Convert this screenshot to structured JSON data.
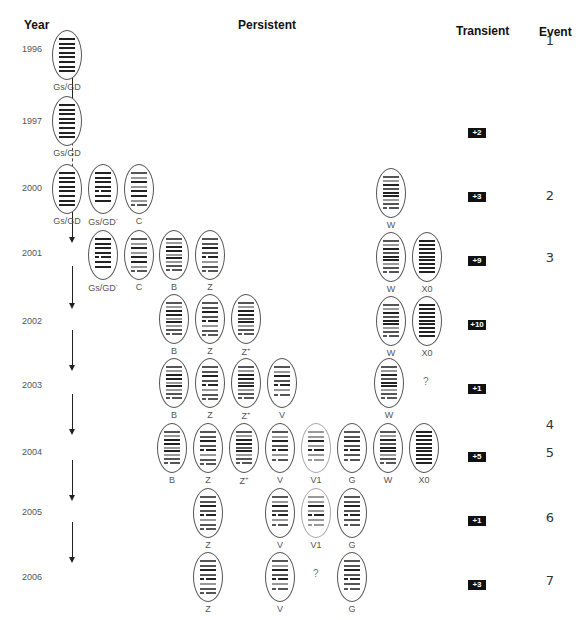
{
  "headers": {
    "year": "Year",
    "persistent": "Persistent",
    "transient": "Transient",
    "event": "Event"
  },
  "colors": {
    "dark_band": "#222222",
    "mid_band": "#555555",
    "light_band": "#999999",
    "badge_bg": "#111111"
  },
  "years": [
    {
      "label": "1996",
      "y": 44
    },
    {
      "label": "1997",
      "y": 116
    },
    {
      "label": "2000",
      "y": 183
    },
    {
      "label": "2001",
      "y": 248
    },
    {
      "label": "2002",
      "y": 316
    },
    {
      "label": "2003",
      "y": 380
    },
    {
      "label": "2004",
      "y": 447
    },
    {
      "label": "2005",
      "y": 507
    },
    {
      "label": "2006",
      "y": 572
    }
  ],
  "transient_counts": [
    {
      "label": "+2",
      "y": 128
    },
    {
      "label": "+3",
      "y": 192
    },
    {
      "label": "+9",
      "y": 256
    },
    {
      "label": "+10",
      "y": 320
    },
    {
      "label": "+1",
      "y": 384
    },
    {
      "label": "+5",
      "y": 452
    },
    {
      "label": "+1",
      "y": 516
    },
    {
      "label": "+3",
      "y": 580
    }
  ],
  "events": [
    {
      "label": "1",
      "y": 33
    },
    {
      "label": "2",
      "y": 188
    },
    {
      "label": "3",
      "y": 250
    },
    {
      "label": "4",
      "y": 417
    },
    {
      "label": "5",
      "y": 445
    },
    {
      "label": "6",
      "y": 510
    },
    {
      "label": "7",
      "y": 573
    }
  ],
  "strains": [
    {
      "row": "1996",
      "label": "Gs/GD",
      "sup": "",
      "x": 52,
      "y": 30,
      "pattern": "gsgd"
    },
    {
      "row": "1997",
      "label": "Gs/GD",
      "sup": "",
      "x": 52,
      "y": 96,
      "pattern": "gsgd"
    },
    {
      "row": "2000",
      "label": "Gs/GD",
      "sup": "",
      "x": 52,
      "y": 164,
      "pattern": "gsgd"
    },
    {
      "row": "2000",
      "label": "Gs/GD",
      "sup": "-",
      "x": 88,
      "y": 164,
      "pattern": "gsgdminus"
    },
    {
      "row": "2000",
      "label": "C",
      "sup": "",
      "x": 124,
      "y": 164,
      "pattern": "c"
    },
    {
      "row": "2000",
      "label": "W",
      "sup": "",
      "x": 376,
      "y": 168,
      "pattern": "w"
    },
    {
      "row": "2001",
      "label": "Gs/GD",
      "sup": "-",
      "x": 88,
      "y": 230,
      "pattern": "gsgdminus"
    },
    {
      "row": "2001",
      "label": "C",
      "sup": "",
      "x": 124,
      "y": 230,
      "pattern": "c"
    },
    {
      "row": "2001",
      "label": "B",
      "sup": "",
      "x": 159,
      "y": 230,
      "pattern": "b"
    },
    {
      "row": "2001",
      "label": "Z",
      "sup": "",
      "x": 195,
      "y": 230,
      "pattern": "z"
    },
    {
      "row": "2001",
      "label": "W",
      "sup": "",
      "x": 376,
      "y": 232,
      "pattern": "w"
    },
    {
      "row": "2001",
      "label": "X0",
      "sup": "",
      "x": 412,
      "y": 232,
      "pattern": "x0"
    },
    {
      "row": "2002",
      "label": "B",
      "sup": "",
      "x": 159,
      "y": 294,
      "pattern": "b"
    },
    {
      "row": "2002",
      "label": "Z",
      "sup": "",
      "x": 195,
      "y": 294,
      "pattern": "z"
    },
    {
      "row": "2002",
      "label": "Z",
      "sup": "+",
      "x": 231,
      "y": 294,
      "pattern": "zplus"
    },
    {
      "row": "2002",
      "label": "W",
      "sup": "",
      "x": 376,
      "y": 296,
      "pattern": "w"
    },
    {
      "row": "2002",
      "label": "X0",
      "sup": "",
      "x": 412,
      "y": 296,
      "pattern": "x0"
    },
    {
      "row": "2003",
      "label": "B",
      "sup": "",
      "x": 159,
      "y": 358,
      "pattern": "b"
    },
    {
      "row": "2003",
      "label": "Z",
      "sup": "",
      "x": 195,
      "y": 358,
      "pattern": "z"
    },
    {
      "row": "2003",
      "label": "Z",
      "sup": "+",
      "x": 231,
      "y": 358,
      "pattern": "zplus"
    },
    {
      "row": "2003",
      "label": "V",
      "sup": "",
      "x": 267,
      "y": 358,
      "pattern": "v"
    },
    {
      "row": "2003",
      "label": "W",
      "sup": "",
      "x": 374,
      "y": 358,
      "pattern": "w"
    },
    {
      "row": "2004",
      "label": "B",
      "sup": "",
      "x": 157,
      "y": 423,
      "pattern": "b"
    },
    {
      "row": "2004",
      "label": "Z",
      "sup": "",
      "x": 193,
      "y": 423,
      "pattern": "z"
    },
    {
      "row": "2004",
      "label": "Z",
      "sup": "+",
      "x": 229,
      "y": 423,
      "pattern": "zplus"
    },
    {
      "row": "2004",
      "label": "V",
      "sup": "",
      "x": 265,
      "y": 423,
      "pattern": "v"
    },
    {
      "row": "2004",
      "label": "V1",
      "sup": "",
      "x": 301,
      "y": 423,
      "pattern": "v1",
      "faint": true
    },
    {
      "row": "2004",
      "label": "G",
      "sup": "",
      "x": 337,
      "y": 423,
      "pattern": "g"
    },
    {
      "row": "2004",
      "label": "W",
      "sup": "",
      "x": 373,
      "y": 423,
      "pattern": "w"
    },
    {
      "row": "2004",
      "label": "X0",
      "sup": "",
      "x": 409,
      "y": 423,
      "pattern": "x0"
    },
    {
      "row": "2005",
      "label": "Z",
      "sup": "",
      "x": 193,
      "y": 488,
      "pattern": "z"
    },
    {
      "row": "2005",
      "label": "V",
      "sup": "",
      "x": 265,
      "y": 488,
      "pattern": "v"
    },
    {
      "row": "2005",
      "label": "V1",
      "sup": "",
      "x": 301,
      "y": 488,
      "pattern": "v1",
      "faint": true
    },
    {
      "row": "2005",
      "label": "G",
      "sup": "",
      "x": 337,
      "y": 488,
      "pattern": "g"
    },
    {
      "row": "2006",
      "label": "Z",
      "sup": "",
      "x": 193,
      "y": 552,
      "pattern": "z"
    },
    {
      "row": "2006",
      "label": "V",
      "sup": "",
      "x": 265,
      "y": 552,
      "pattern": "v"
    },
    {
      "row": "2006",
      "label": "G",
      "sup": "",
      "x": 337,
      "y": 552,
      "pattern": "g"
    }
  ],
  "unknowns": [
    {
      "label": "?",
      "x": 423,
      "y": 376
    },
    {
      "label": "?",
      "x": 313,
      "y": 568
    }
  ],
  "patterns": {
    "gsgd": [
      [
        "d"
      ],
      [
        "d"
      ],
      [
        "d"
      ],
      [
        "d"
      ],
      [
        "d"
      ],
      [
        "d"
      ],
      [
        "d"
      ],
      [
        "d"
      ]
    ],
    "gsgdminus": [
      [
        "d"
      ],
      [
        "d"
      ],
      [
        "d"
      ],
      [
        "d"
      ],
      [
        "d",
        "d"
      ],
      [
        "d"
      ],
      [
        "d"
      ]
    ],
    "c": [
      [
        "m"
      ],
      [
        "l"
      ],
      [
        "d"
      ],
      [
        "l"
      ],
      [
        "d"
      ],
      [
        "d"
      ],
      [
        "l"
      ],
      [
        "m",
        "m"
      ]
    ],
    "b": [
      [
        "m"
      ],
      [
        "l"
      ],
      [
        "d"
      ],
      [
        "d"
      ],
      [
        "l"
      ],
      [
        "d"
      ],
      [
        "l"
      ],
      [
        "m"
      ],
      [
        "m",
        "m"
      ]
    ],
    "z": [
      [
        "m"
      ],
      [
        "m"
      ],
      [
        "d"
      ],
      [
        "m"
      ],
      [
        "d",
        "d"
      ],
      [
        "l"
      ],
      [
        "m"
      ],
      [
        "m",
        "m"
      ]
    ],
    "zplus": [
      [
        "m"
      ],
      [
        "l"
      ],
      [
        "d"
      ],
      [
        "d"
      ],
      [
        "m"
      ],
      [
        "d"
      ],
      [
        "l"
      ],
      [
        "m"
      ],
      [
        "m",
        "m"
      ]
    ],
    "v": [
      [
        "m"
      ],
      [
        "l"
      ],
      [
        "d"
      ],
      [
        "m"
      ],
      [
        "d",
        "d"
      ],
      [
        "l"
      ],
      [
        "m",
        "m"
      ]
    ],
    "v1": [
      [
        "l"
      ],
      [
        "l"
      ],
      [
        "d"
      ],
      [
        "l"
      ],
      [
        "d",
        "d"
      ],
      [
        "l"
      ],
      [
        "l",
        "l"
      ]
    ],
    "g": [
      [
        "m"
      ],
      [
        "m"
      ],
      [
        "d"
      ],
      [
        "m"
      ],
      [
        "d",
        "d"
      ],
      [
        "m"
      ],
      [
        "m",
        "m"
      ]
    ],
    "w": [
      [
        "m"
      ],
      [
        "l"
      ],
      [
        "d"
      ],
      [
        "m"
      ],
      [
        "d"
      ],
      [
        "d"
      ],
      [
        "l"
      ],
      [
        "m"
      ],
      [
        "m",
        "m"
      ]
    ],
    "x0": [
      [
        "d"
      ],
      [
        "d"
      ],
      [
        "d"
      ],
      [
        "d"
      ],
      [
        "d"
      ],
      [
        "d"
      ],
      [
        "d"
      ],
      [
        "d"
      ],
      [
        "d"
      ]
    ]
  },
  "arrows": [
    {
      "x": 72,
      "top": 62,
      "height": 44,
      "dotted": false
    },
    {
      "x": 72,
      "top": 132,
      "height": 40,
      "dotted": true
    },
    {
      "x": 72,
      "top": 200,
      "height": 38,
      "dotted": false
    },
    {
      "x": 72,
      "top": 266,
      "height": 38,
      "dotted": false
    },
    {
      "x": 72,
      "top": 330,
      "height": 36,
      "dotted": false
    },
    {
      "x": 72,
      "top": 394,
      "height": 36,
      "dotted": false
    },
    {
      "x": 72,
      "top": 460,
      "height": 36,
      "dotted": false
    },
    {
      "x": 72,
      "top": 522,
      "height": 36,
      "dotted": false
    }
  ]
}
